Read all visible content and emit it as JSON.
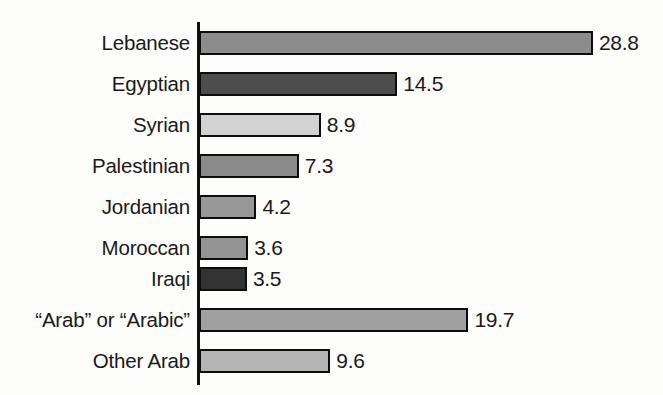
{
  "chart_data": {
    "type": "bar",
    "orientation": "horizontal",
    "title": "",
    "subtitle": "",
    "xlabel": "",
    "ylabel": "",
    "xlim": [
      0,
      28.8
    ],
    "grid": false,
    "legend": null,
    "categories": [
      "Lebanese",
      "Egyptian",
      "Syrian",
      "Palestinian",
      "Jordanian",
      "Moroccan",
      "Iraqi",
      "“Arab” or “Arabic”",
      "Other Arab"
    ],
    "values": [
      28.8,
      14.5,
      8.9,
      7.3,
      4.2,
      3.6,
      3.5,
      19.7,
      9.6
    ],
    "value_labels": [
      "28.8",
      "14.5",
      "8.9",
      "7.3",
      "4.2",
      "3.6",
      "3.5",
      "19.7",
      "9.6"
    ],
    "bar_colors": [
      "#8c8c8c",
      "#4d4d4d",
      "#d2d2d2",
      "#8a8a8a",
      "#989898",
      "#949494",
      "#333333",
      "#a0a0a0",
      "#b4b4b4"
    ],
    "bar_border_color": "#0d0d0d",
    "axis_color": "#111111",
    "background_color": "#fdfdfc",
    "text_color": "#1a1a1a"
  }
}
